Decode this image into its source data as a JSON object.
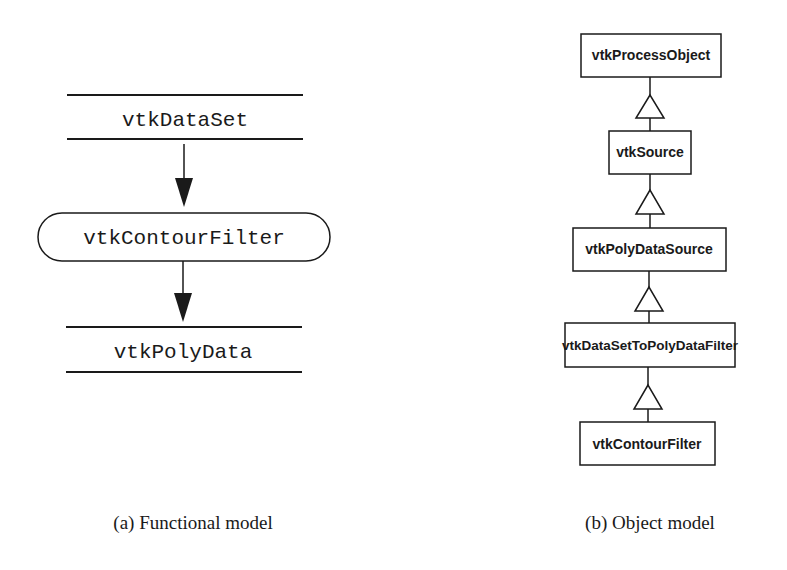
{
  "functional_model": {
    "caption": "(a) Functional model",
    "input": "vtkDataSet",
    "process": "vtkContourFilter",
    "output": "vtkPolyData"
  },
  "object_model": {
    "caption": "(b) Object model",
    "classes": [
      "vtkProcessObject",
      "vtkSource",
      "vtkPolyDataSource",
      "vtkDataSetToPolyDataFilter",
      "vtkContourFilter"
    ]
  },
  "colors": {
    "stroke": "#1a1a1a",
    "background": "#ffffff"
  }
}
